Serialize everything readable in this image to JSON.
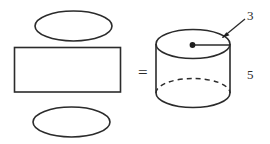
{
  "figure": {
    "background_color": "#ffffff",
    "line_color": "#2b2b2b",
    "equals_sign": "=",
    "net": {
      "name": "cylinder-net",
      "top_circle_label": "",
      "rectangle_label": "",
      "bottom_circle_label": ""
    },
    "cylinder": {
      "name": "cylinder-solid",
      "radius_label": "3",
      "height_label": "5",
      "center_point_label": ""
    }
  }
}
